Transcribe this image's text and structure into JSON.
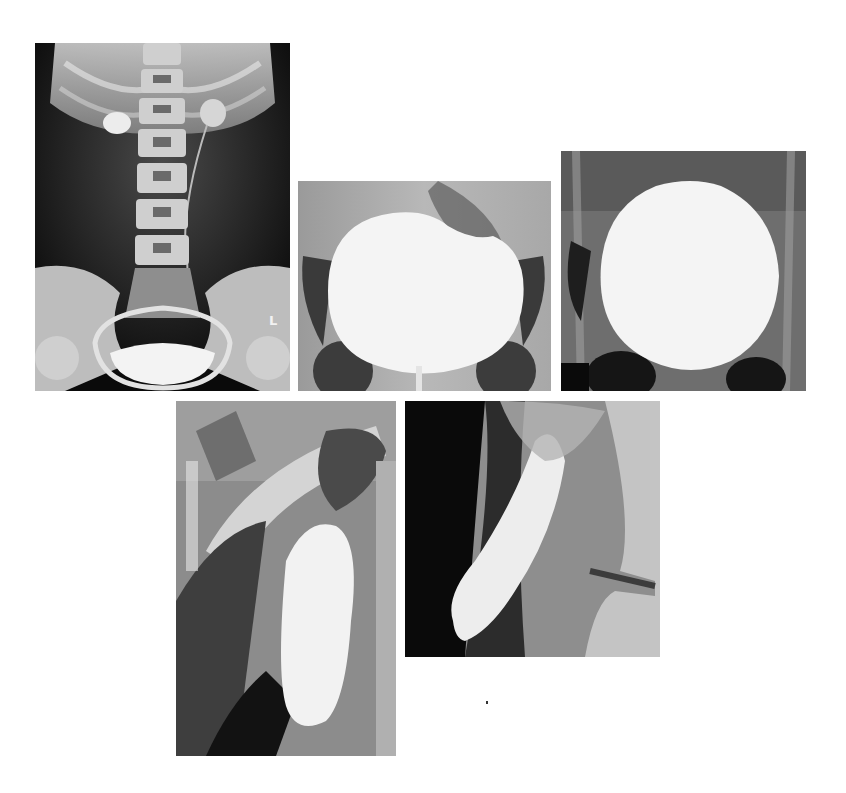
{
  "figure": {
    "panels": [
      {
        "id": "A",
        "description": "Abdominal plain radiograph (KUB/IVU) with spine, pelvis and bladder",
        "side_marker": "L"
      },
      {
        "id": "B",
        "description": "Pelvic cystogram, contrast-filled bladder, indented dome"
      },
      {
        "id": "C",
        "description": "Pelvic cystogram, large round contrast-filled bladder"
      },
      {
        "id": "D",
        "description": "Oblique close-up contrast study of tubular structure"
      },
      {
        "id": "E",
        "description": "Close-up contrast study of blind-ending tubular structure"
      }
    ],
    "colors": {
      "background": "#ffffff",
      "film_dark": "#0c0c0c",
      "contrast_white": "#f4f4f4",
      "bone_gray": "#bdbdbd"
    }
  }
}
